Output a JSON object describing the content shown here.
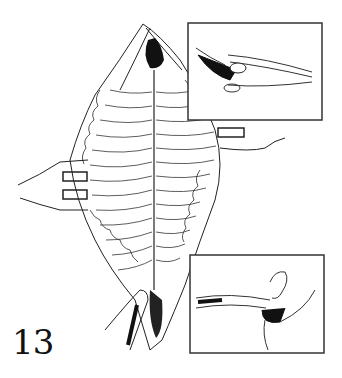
{
  "figure": {
    "number": "13",
    "insets": [
      {
        "position": "top-right",
        "content": "cross-section diagram with instrument"
      },
      {
        "position": "bottom-right",
        "content": "cross-section diagram with finger manipulation"
      }
    ],
    "colors": {
      "ink": "#111111",
      "paper": "#ffffff"
    }
  }
}
